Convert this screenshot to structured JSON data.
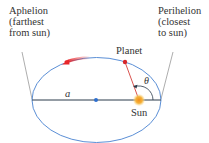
{
  "diagram": {
    "top_cropped_text": "",
    "labels": {
      "aphelion": [
        "Aphelion",
        "(farthest",
        "from sun)"
      ],
      "perihelion": [
        "Perihelion",
        "(closest",
        "to sun)"
      ],
      "planet": "Planet",
      "sun": "Sun",
      "semi_major_axis": "a",
      "angle": "θ"
    },
    "colors": {
      "ellipse": "#5b8fd6",
      "axis": "#2b3a4a",
      "planet": "#d6262a",
      "radius_line": "#d9534f",
      "sun": "#f5a623",
      "center_dot": "#2e6fcf",
      "motion_arrow": "#e8262a",
      "leader_line": "#888888"
    },
    "geometry": {
      "ellipse": {
        "cx": 96.5,
        "cy": 100,
        "rx": 64.5,
        "ry": 43
      },
      "planet": {
        "x": 125,
        "y": 62
      },
      "sun": {
        "x": 139,
        "y": 100
      },
      "center": {
        "x": 96,
        "y": 100
      }
    }
  }
}
